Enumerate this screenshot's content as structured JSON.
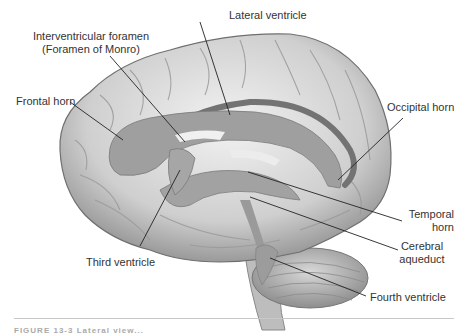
{
  "figure": {
    "type": "anatomical illustration, lateral view of brain with ventricular system",
    "colors": {
      "background": "#ffffff",
      "brain_light": "#e6e6e6",
      "brain_mid": "#c4c4c4",
      "brain_dark": "#8a8a8a",
      "ventricle": "#9f9f9f",
      "ventricle_dark": "#6e6e6e",
      "leader_line": "#222222",
      "label_text": "#333333"
    },
    "labels": [
      {
        "id": "lateral-ventricle",
        "text": "Lateral ventricle"
      },
      {
        "id": "interventricular-foramen",
        "line1": "Interventricular foramen",
        "line2": "(Foramen of Monro)"
      },
      {
        "id": "frontal-horn",
        "text": "Frontal horn"
      },
      {
        "id": "occipital-horn",
        "text": "Occipital horn"
      },
      {
        "id": "temporal-horn",
        "line1": "Temporal",
        "line2": "horn"
      },
      {
        "id": "cerebral-aqueduct",
        "line1": "Cerebral",
        "line2": "aqueduct"
      },
      {
        "id": "third-ventricle",
        "text": "Third ventricle"
      },
      {
        "id": "fourth-ventricle",
        "text": "Fourth ventricle"
      }
    ],
    "caption": "FIGURE 13-3 Lateral view..."
  }
}
